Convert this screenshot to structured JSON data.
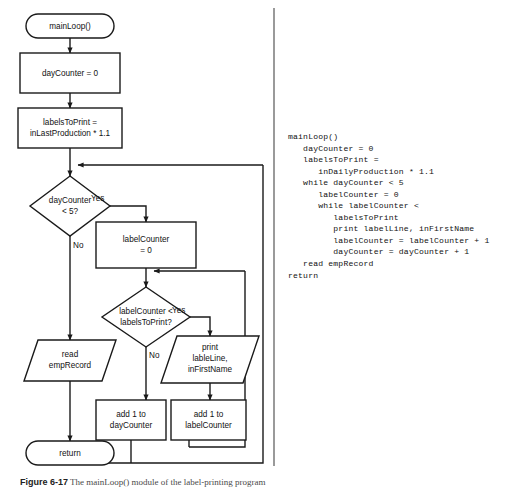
{
  "figure": {
    "caption_label": "Figure 6-17",
    "caption_text": "The mainLoop() module of the label-printing program"
  },
  "flowchart": {
    "nodes": {
      "start": {
        "label": "mainLoop()",
        "shape": "terminator"
      },
      "init_day": {
        "label": "dayCounter = 0",
        "shape": "process"
      },
      "init_labels_line1": {
        "label": "labelsToPrint =",
        "shape": "process"
      },
      "init_labels_line2": {
        "label": "inLastProduction * 1.1",
        "shape": "process"
      },
      "day_decision_line1": {
        "label": "dayCounter",
        "shape": "decision"
      },
      "day_decision_line2": {
        "label": "< 5?",
        "shape": "decision"
      },
      "init_label_counter_line1": {
        "label": "labelCounter",
        "shape": "process"
      },
      "init_label_counter_line2": {
        "label": "= 0",
        "shape": "process"
      },
      "label_decision_line1": {
        "label": "labelCounter <",
        "shape": "decision"
      },
      "label_decision_line2": {
        "label": "labelsToPrint?",
        "shape": "decision"
      },
      "print_line1": {
        "label": "print",
        "shape": "io"
      },
      "print_line2": {
        "label": "lableLine,",
        "shape": "io"
      },
      "print_line3": {
        "label": "inFirstName",
        "shape": "io"
      },
      "read_line1": {
        "label": "read",
        "shape": "io"
      },
      "read_line2": {
        "label": "empRecord",
        "shape": "io"
      },
      "add_day_line1": {
        "label": "add 1 to",
        "shape": "process"
      },
      "add_day_line2": {
        "label": "dayCounter",
        "shape": "process"
      },
      "add_label_line1": {
        "label": "add 1 to",
        "shape": "process"
      },
      "add_label_line2": {
        "label": "labelCounter",
        "shape": "process"
      },
      "end": {
        "label": "return",
        "shape": "terminator"
      }
    },
    "branch_labels": {
      "day_yes": "Yes",
      "day_no": "No",
      "label_yes": "Yes",
      "label_no": "No"
    }
  },
  "pseudocode": {
    "text": "mainLoop()\n   dayCounter = 0\n   labelsToPrint =\n      inDailyProduction * 1.1\n   while dayCounter < 5\n      labelCounter = 0\n      while labelCounter <\n         labelsToPrint\n         print labelLine, inFirstName\n         labelCounter = labelCounter + 1\n         dayCounter = dayCounter + 1\n   read empRecord\nreturn"
  },
  "colors": {
    "stroke": "#1a1a1a",
    "fill": "#ffffff",
    "divider": "#9a9a9a",
    "text": "#111111"
  }
}
